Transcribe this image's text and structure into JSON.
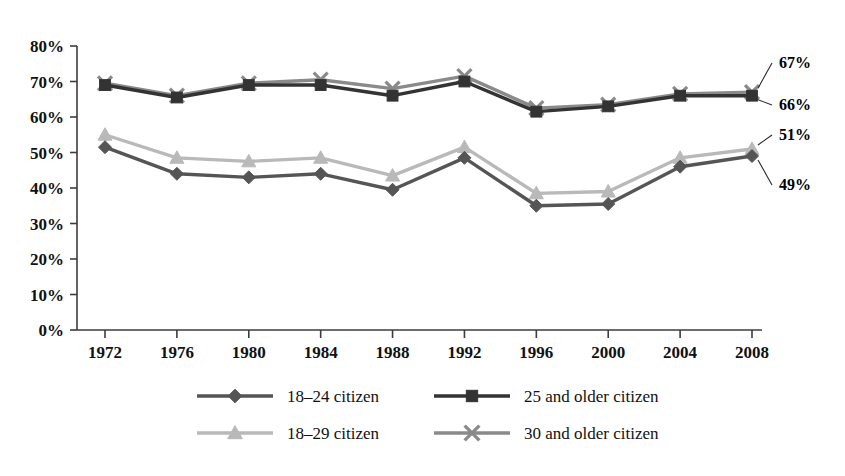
{
  "chart_data": {
    "type": "line",
    "title": "",
    "subtitle": "",
    "xlabel": "",
    "ylabel": "",
    "categories": [
      "1972",
      "1976",
      "1980",
      "1984",
      "1988",
      "1992",
      "1996",
      "2000",
      "2004",
      "2008"
    ],
    "x": [
      1972,
      1976,
      1980,
      1984,
      1988,
      1992,
      1996,
      2000,
      2004,
      2008
    ],
    "ylim": [
      0,
      80
    ],
    "ytick_labels": [
      "0%",
      "10%",
      "20%",
      "30%",
      "40%",
      "50%",
      "60%",
      "70%",
      "80%"
    ],
    "ytick_values": [
      0,
      10,
      20,
      30,
      40,
      50,
      60,
      70,
      80
    ],
    "grid": false,
    "legend_position": "bottom",
    "series": [
      {
        "name": "18–24 citizen",
        "marker": "diamond",
        "color": "#555555",
        "values": [
          51.5,
          44,
          43,
          44,
          39.5,
          48.5,
          35,
          35.5,
          46,
          49
        ],
        "end_label": "49%"
      },
      {
        "name": "25 and older citizen",
        "marker": "square",
        "color": "#333333",
        "values": [
          69,
          65.5,
          69,
          69,
          66,
          70,
          61.5,
          63,
          66,
          66
        ],
        "end_label": "66%"
      },
      {
        "name": "18–29 citizen",
        "marker": "triangle",
        "color": "#b9b9b9",
        "values": [
          55,
          48.5,
          47.5,
          48.5,
          43.5,
          51.5,
          38.5,
          39,
          48.5,
          51
        ],
        "end_label": "51%"
      },
      {
        "name": "30 and older citizen",
        "marker": "x",
        "color": "#8a8a8a",
        "values": [
          69.5,
          66,
          69.5,
          70.5,
          68,
          71.5,
          62.5,
          63.5,
          66.5,
          67
        ],
        "end_label": "67%"
      }
    ],
    "end_labels": [
      "67%",
      "66%",
      "51%",
      "49%"
    ]
  },
  "legend": {
    "items": [
      {
        "label": "18–24 citizen",
        "marker": "diamond",
        "color": "#555555"
      },
      {
        "label": "25 and older citizen",
        "marker": "square",
        "color": "#333333"
      },
      {
        "label": "18–29 citizen",
        "marker": "triangle",
        "color": "#b9b9b9"
      },
      {
        "label": "30 and older citizen",
        "marker": "x",
        "color": "#8a8a8a"
      }
    ]
  },
  "axis": {
    "y_labels": [
      "80%",
      "70%",
      "60%",
      "50%",
      "40%",
      "30%",
      "20%",
      "10%",
      "0%"
    ],
    "x_labels": [
      "1972",
      "1976",
      "1980",
      "1984",
      "1988",
      "1992",
      "1996",
      "2000",
      "2004",
      "2008"
    ]
  }
}
